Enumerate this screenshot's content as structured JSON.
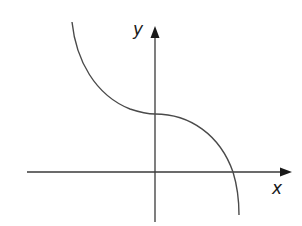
{
  "diagram": {
    "type": "function-sketch",
    "axes": {
      "x_label": "x",
      "y_label": "y"
    },
    "curve": {
      "shape": "decreasing cubic with horizontal point of inflection",
      "features": [
        "starts high in second quadrant",
        "flattens to horizontal tangent at positive y-intercept",
        "crosses positive x-axis",
        "continues downward below x-axis"
      ]
    },
    "colors": {
      "axes": "#3a3a3a",
      "curve": "#4a4a4a",
      "background": "#ffffff"
    }
  }
}
